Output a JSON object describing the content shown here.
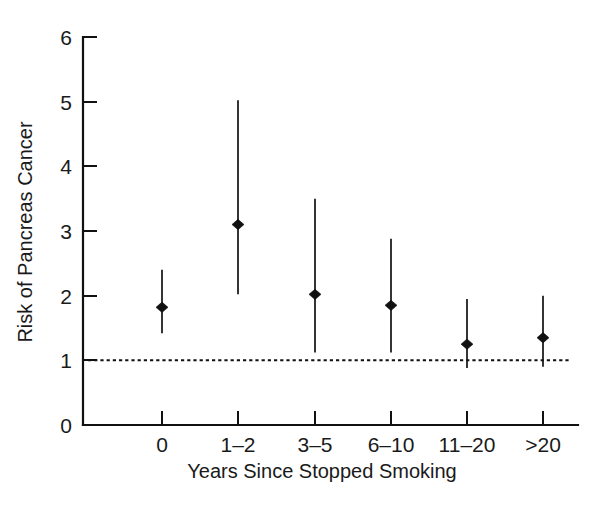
{
  "chart_data": {
    "type": "scatter",
    "title": "",
    "xlabel": "Years Since Stopped Smoking",
    "ylabel": "Risk of Pancreas Cancer",
    "categories": [
      "0",
      "1–2",
      "3–5",
      "6–10",
      "11–20",
      ">20"
    ],
    "values": [
      1.82,
      3.1,
      2.02,
      1.85,
      1.25,
      1.35
    ],
    "error_low": [
      1.42,
      2.02,
      1.12,
      1.12,
      0.88,
      0.9
    ],
    "error_high": [
      2.4,
      5.02,
      3.5,
      2.88,
      1.95,
      2.0
    ],
    "reference_line": 1.0,
    "reference_line_style": "dotted",
    "ylim": [
      0,
      6
    ],
    "yticks": [
      0,
      1,
      2,
      3,
      4,
      5,
      6
    ],
    "ytick_labels": [
      "0",
      "1",
      "2",
      "3",
      "4",
      "5",
      "6"
    ],
    "grid": false,
    "legend": null,
    "marker": "filled-diamond",
    "series_name": "Relative risk",
    "color": "#111111"
  },
  "axes": {
    "y_title": "Risk of Pancreas Cancer",
    "x_title": "Years Since Stopped Smoking"
  }
}
